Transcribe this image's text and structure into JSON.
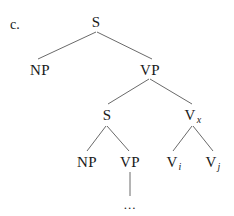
{
  "example_label": "c.",
  "tree": {
    "root": {
      "label": "S"
    },
    "subject": {
      "label": "NP"
    },
    "predicate": {
      "label": "VP"
    },
    "embedded_clause": {
      "label": "S"
    },
    "embedded_np": {
      "label": "NP"
    },
    "embedded_vp": {
      "label": "VP"
    },
    "embedded_vp_content": {
      "label": "..."
    },
    "complex_verb": {
      "label": "V",
      "subscript": "x"
    },
    "verb_i": {
      "label": "V",
      "subscript": "i"
    },
    "verb_j": {
      "label": "V",
      "subscript": "j"
    }
  }
}
